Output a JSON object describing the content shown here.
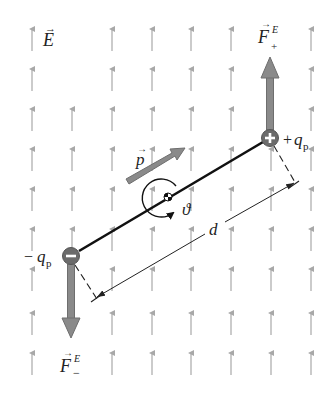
{
  "diagram": {
    "colors": {
      "field_arrow": "#a8a8a8",
      "force_arrow": "#8a8a8a",
      "force_arrow_outline": "#6e6e6e",
      "charge_fill": "#6b6b6b",
      "charge_symbol": "#ffffff",
      "dipole_rod": "#111111",
      "dimension_line": "#222222"
    },
    "field": {
      "label": "E",
      "vector_mark": "→",
      "direction": "up",
      "columns_x": [
        32,
        72,
        112,
        152,
        191,
        231,
        271,
        311
      ],
      "rows_y": [
        26,
        66,
        106,
        146,
        186,
        226,
        266,
        310,
        350
      ],
      "arrow_length": 25
    },
    "positive_charge": {
      "symbol": "+",
      "label_sign": "+",
      "label_var": "q",
      "label_sub": "p",
      "x": 270,
      "y": 138
    },
    "negative_charge": {
      "symbol": "−",
      "label_sign": "−",
      "label_var": "q",
      "label_sub": "p",
      "x": 71,
      "y": 256
    },
    "force_positive": {
      "label_var": "F",
      "label_sup": "E",
      "label_sub": "+",
      "direction": "up"
    },
    "force_negative": {
      "label_var": "F",
      "label_sup": "E",
      "label_sub": "−",
      "direction": "down"
    },
    "dipole_moment": {
      "label": "p",
      "vector_mark": "→"
    },
    "angle": {
      "label": "ϑ"
    },
    "separation": {
      "label": "d"
    }
  }
}
